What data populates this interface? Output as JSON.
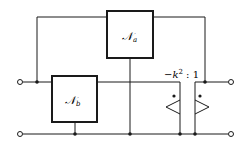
{
  "diagram": {
    "type": "circuit",
    "blocks": [
      {
        "id": "Na",
        "label": "𝒩",
        "subscript": "a"
      },
      {
        "id": "Nb",
        "label": "𝒩",
        "subscript": "b"
      }
    ],
    "transformer": {
      "ratio_label": "−k² : 1",
      "ratio_prefix": "−k",
      "ratio_exp": "2",
      "ratio_suffix": " : 1"
    },
    "terminals": [
      "left-top",
      "left-bottom",
      "right-top",
      "right-bottom"
    ],
    "colors": {
      "line": "#1a1a1a",
      "background": "#ffffff"
    }
  }
}
